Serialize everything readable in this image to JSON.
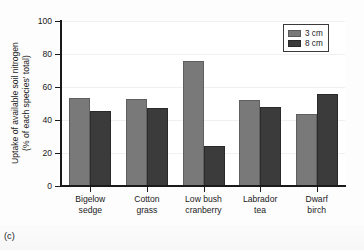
{
  "figure": {
    "panel_label": "(c)"
  },
  "chart_data": {
    "type": "bar",
    "title": "",
    "xlabel": "",
    "ylabel": "Uptake of available soil nitrogen (% of each species' total)",
    "ylabel_line1": "Uptake of available soil nitrogen",
    "ylabel_line2": "(% of each species' total)",
    "ylim": [
      0,
      100
    ],
    "yticks": [
      0,
      20,
      40,
      60,
      80,
      100
    ],
    "ytick_labels": [
      "0",
      "20",
      "40",
      "60",
      "80",
      "100"
    ],
    "grid": true,
    "legend_position": "top-right",
    "categories": [
      "Bigelow sedge",
      "Cotton grass",
      "Low bush cranberry",
      "Labrador tea",
      "Dwarf birch"
    ],
    "category_lines": [
      [
        "Bigelow",
        "sedge"
      ],
      [
        "Cotton",
        "grass"
      ],
      [
        "Low bush",
        "cranberry"
      ],
      [
        "Labrador",
        "tea"
      ],
      [
        "Dwarf",
        "birch"
      ]
    ],
    "series": [
      {
        "name": "3 cm",
        "color": "#797979",
        "values": [
          53.5,
          53,
          76,
          52,
          43.5
        ]
      },
      {
        "name": "8 cm",
        "color": "#3b3b3b",
        "values": [
          45.5,
          47.5,
          24.5,
          48,
          56
        ]
      }
    ]
  },
  "legend": {
    "entries": [
      {
        "label": "3 cm",
        "color": "#797979"
      },
      {
        "label": "8 cm",
        "color": "#3b3b3b"
      }
    ]
  }
}
